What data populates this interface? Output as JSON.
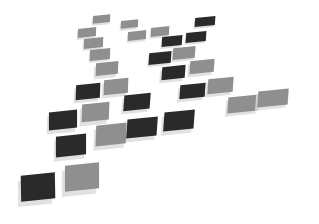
{
  "image": {
    "description": "Abstract perspective grid of square tiles in dark and light gray on white background, casting soft shadows",
    "background": "#ffffff",
    "colors": {
      "dark": "#2a2a2a",
      "gray": "#8f8f8f",
      "shadow": "#dcdcdc"
    },
    "tiles": [
      {
        "x": 93,
        "y": 15,
        "w": 17,
        "h": 8,
        "skew": -8,
        "tone": "gray"
      },
      {
        "x": 121,
        "y": 20,
        "w": 17,
        "h": 8,
        "skew": -8,
        "tone": "gray"
      },
      {
        "x": 78,
        "y": 28,
        "w": 18,
        "h": 9,
        "skew": -8,
        "tone": "gray"
      },
      {
        "x": 128,
        "y": 31,
        "w": 18,
        "h": 9,
        "skew": -8,
        "tone": "gray"
      },
      {
        "x": 151,
        "y": 27,
        "w": 18,
        "h": 9,
        "skew": -8,
        "tone": "gray"
      },
      {
        "x": 195,
        "y": 17,
        "w": 20,
        "h": 9,
        "skew": -10,
        "tone": "dark"
      },
      {
        "x": 162,
        "y": 36,
        "w": 20,
        "h": 10,
        "skew": -10,
        "tone": "dark"
      },
      {
        "x": 186,
        "y": 32,
        "w": 20,
        "h": 10,
        "skew": -10,
        "tone": "dark"
      },
      {
        "x": 84,
        "y": 38,
        "w": 19,
        "h": 10,
        "skew": -8,
        "tone": "gray"
      },
      {
        "x": 90,
        "y": 49,
        "w": 20,
        "h": 11,
        "skew": -8,
        "tone": "gray"
      },
      {
        "x": 149,
        "y": 52,
        "w": 22,
        "h": 12,
        "skew": -10,
        "tone": "dark"
      },
      {
        "x": 173,
        "y": 47,
        "w": 22,
        "h": 12,
        "skew": -10,
        "tone": "gray"
      },
      {
        "x": 96,
        "y": 62,
        "w": 22,
        "h": 13,
        "skew": -8,
        "tone": "gray"
      },
      {
        "x": 162,
        "y": 66,
        "w": 23,
        "h": 13,
        "skew": -10,
        "tone": "dark"
      },
      {
        "x": 190,
        "y": 60,
        "w": 24,
        "h": 13,
        "skew": -10,
        "tone": "gray"
      },
      {
        "x": 76,
        "y": 84,
        "w": 24,
        "h": 15,
        "skew": -8,
        "tone": "dark"
      },
      {
        "x": 104,
        "y": 79,
        "w": 24,
        "h": 15,
        "skew": -8,
        "tone": "gray"
      },
      {
        "x": 180,
        "y": 84,
        "w": 25,
        "h": 14,
        "skew": -10,
        "tone": "dark"
      },
      {
        "x": 208,
        "y": 78,
        "w": 25,
        "h": 15,
        "skew": -10,
        "tone": "gray"
      },
      {
        "x": 124,
        "y": 94,
        "w": 26,
        "h": 16,
        "skew": -10,
        "tone": "dark"
      },
      {
        "x": 228,
        "y": 96,
        "w": 30,
        "h": 16,
        "skew": -10,
        "tone": "gray"
      },
      {
        "x": 258,
        "y": 90,
        "w": 30,
        "h": 16,
        "skew": -10,
        "tone": "gray"
      },
      {
        "x": 49,
        "y": 111,
        "w": 28,
        "h": 18,
        "skew": -6,
        "tone": "dark"
      },
      {
        "x": 82,
        "y": 103,
        "w": 27,
        "h": 18,
        "skew": -8,
        "tone": "gray"
      },
      {
        "x": 127,
        "y": 118,
        "w": 30,
        "h": 19,
        "skew": -10,
        "tone": "dark"
      },
      {
        "x": 164,
        "y": 111,
        "w": 30,
        "h": 19,
        "skew": -10,
        "tone": "dark"
      },
      {
        "x": 56,
        "y": 135,
        "w": 30,
        "h": 21,
        "skew": -6,
        "tone": "dark"
      },
      {
        "x": 96,
        "y": 124,
        "w": 30,
        "h": 21,
        "skew": -8,
        "tone": "gray"
      },
      {
        "x": 21,
        "y": 174,
        "w": 34,
        "h": 26,
        "skew": -5,
        "tone": "dark"
      },
      {
        "x": 65,
        "y": 164,
        "w": 34,
        "h": 26,
        "skew": -6,
        "tone": "gray"
      }
    ]
  }
}
